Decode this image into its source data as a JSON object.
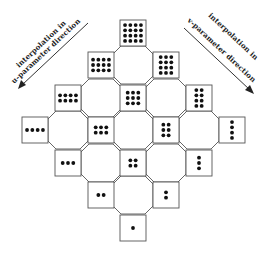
{
  "diagram": {
    "type": "tensor-product interpolation lattice",
    "labels": {
      "u_direction": {
        "line1": "interpolation in",
        "line2": "u-parameter direction"
      },
      "v_direction": {
        "line1": "interpolation in",
        "line2": "v-parameter direction"
      }
    },
    "colors": {
      "stroke": "#555555",
      "dot": "#111111",
      "background": "#ffffff",
      "text": "#222222"
    },
    "square_size": 26,
    "squares": [
      {
        "x": 120,
        "y": 20,
        "cols": 4,
        "rows": 4
      },
      {
        "x": 88,
        "y": 52,
        "cols": 4,
        "rows": 3
      },
      {
        "x": 153,
        "y": 52,
        "cols": 3,
        "rows": 4
      },
      {
        "x": 55,
        "y": 85,
        "cols": 4,
        "rows": 2
      },
      {
        "x": 120,
        "y": 85,
        "cols": 3,
        "rows": 3
      },
      {
        "x": 186,
        "y": 85,
        "cols": 2,
        "rows": 4
      },
      {
        "x": 22,
        "y": 117,
        "cols": 4,
        "rows": 1
      },
      {
        "x": 88,
        "y": 117,
        "cols": 3,
        "rows": 2
      },
      {
        "x": 153,
        "y": 117,
        "cols": 2,
        "rows": 3
      },
      {
        "x": 219,
        "y": 117,
        "cols": 1,
        "rows": 4
      },
      {
        "x": 55,
        "y": 150,
        "cols": 3,
        "rows": 1
      },
      {
        "x": 120,
        "y": 150,
        "cols": 2,
        "rows": 2
      },
      {
        "x": 186,
        "y": 150,
        "cols": 1,
        "rows": 3
      },
      {
        "x": 88,
        "y": 182,
        "cols": 2,
        "rows": 1
      },
      {
        "x": 153,
        "y": 182,
        "cols": 1,
        "rows": 2
      },
      {
        "x": 120,
        "y": 215,
        "cols": 1,
        "rows": 1
      }
    ],
    "octagons": [
      {
        "cx": 133,
        "cy": 65
      },
      {
        "cx": 101,
        "cy": 98
      },
      {
        "cx": 166,
        "cy": 98
      },
      {
        "cx": 68,
        "cy": 130
      },
      {
        "cx": 133,
        "cy": 130
      },
      {
        "cx": 199,
        "cy": 130
      },
      {
        "cx": 101,
        "cy": 163
      },
      {
        "cx": 166,
        "cy": 163
      },
      {
        "cx": 133,
        "cy": 195
      }
    ]
  }
}
